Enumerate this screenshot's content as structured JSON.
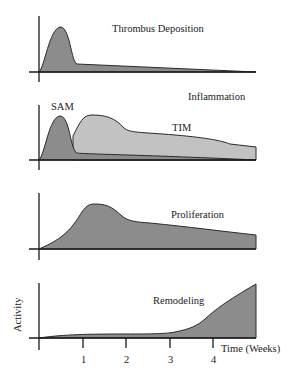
{
  "panels": [
    {
      "id": "thrombus",
      "label": "Thrombus Deposition",
      "series": [
        {
          "name": "Thrombus Deposition",
          "fill": "#8c8c8c",
          "path": "M39,72 C45,66 49,30 60,27 C70,26 71,62 77,64 L256,72 Z"
        }
      ]
    },
    {
      "id": "inflammation",
      "label": "Inflammation",
      "series": [
        {
          "name": "TIM",
          "fill": "#c2c2c2",
          "path": "M73,136 C80,122 83,115 92,115 C106,115 115,118 124,128 C130,133 140,132 175,135 C210,138 222,141 230,144 L256,147 L256,160 L73,160 Z"
        },
        {
          "name": "SAM",
          "fill": "#8c8c8c",
          "path": "M39,160 C45,154 49,117 60,116 C70,116 70,150 77,153 C80,154 150,155 256,160 Z"
        }
      ],
      "annotations": [
        {
          "text": "SAM",
          "x": 51,
          "y": 110
        },
        {
          "text": "TIM",
          "x": 172,
          "y": 131
        }
      ]
    },
    {
      "id": "proliferation",
      "label": "Proliferation",
      "series": [
        {
          "name": "Proliferation",
          "fill": "#8c8c8c",
          "path": "M39,249 C55,242 68,235 80,215 C86,206 88,204 95,204 C110,204 115,210 122,216 C128,221 135,222 150,223 C190,227 220,231 256,235 L256,249 Z"
        }
      ]
    },
    {
      "id": "remodeling",
      "label": "Remodeling",
      "series": [
        {
          "name": "Remodeling",
          "fill": "#8c8c8c",
          "path": "M39,338 C60,335 80,334 120,334 C150,334 165,334 175,332 C190,329 197,326 205,319 C215,310 225,302 256,284 L256,338 Z"
        }
      ]
    }
  ],
  "axes": {
    "y_label": "Activity",
    "x_label": "Time (Weeks)",
    "x_ticks": [
      "1",
      "2",
      "3",
      "4"
    ]
  },
  "colors": {
    "dark_fill": "#8c8c8c",
    "light_fill": "#c2c2c2",
    "axis": "#1a1a1a",
    "text": "#222222"
  }
}
